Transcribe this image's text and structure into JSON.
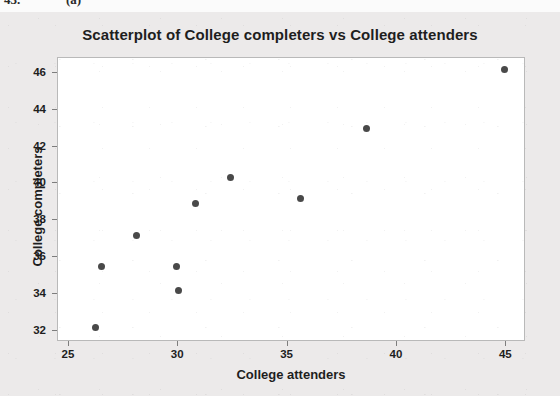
{
  "page_artifact": {
    "exercise_number": "43.",
    "part_label": "(a)"
  },
  "colors": {
    "figure_background": "#eceaea",
    "plot_background": "#ffffff",
    "plot_border": "#b9b9b9",
    "point_color": "#494949",
    "text_color": "#1e1e1e",
    "tick_color": "#7d7d7d"
  },
  "chart_data": {
    "type": "scatter",
    "title": "Scatterplot of College completers vs College attenders",
    "xlabel": "College attenders",
    "ylabel": "College completers",
    "xlim": [
      24.5,
      45.9
    ],
    "ylim": [
      31.4,
      46.8
    ],
    "xticks": [
      25,
      30,
      35,
      40,
      45
    ],
    "yticks": [
      32,
      34,
      36,
      38,
      40,
      42,
      44,
      46
    ],
    "xtick_labels": [
      "25",
      "30",
      "35",
      "40",
      "45"
    ],
    "ytick_labels": [
      "32",
      "34",
      "36",
      "38",
      "40",
      "42",
      "44",
      "46"
    ],
    "grid": false,
    "legend": null,
    "marker": "filled-circle",
    "points": [
      {
        "x": 26.2,
        "y": 32.2
      },
      {
        "x": 26.5,
        "y": 35.5
      },
      {
        "x": 28.1,
        "y": 37.2
      },
      {
        "x": 29.9,
        "y": 35.5
      },
      {
        "x": 30.0,
        "y": 34.2
      },
      {
        "x": 30.8,
        "y": 38.9
      },
      {
        "x": 32.4,
        "y": 40.3
      },
      {
        "x": 35.6,
        "y": 39.2
      },
      {
        "x": 38.6,
        "y": 43.0
      },
      {
        "x": 44.9,
        "y": 46.2
      }
    ]
  }
}
